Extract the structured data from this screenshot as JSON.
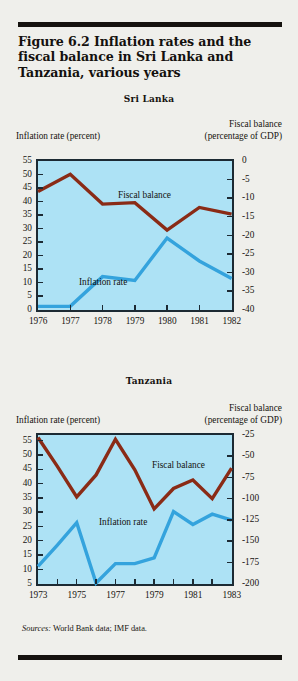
{
  "figure": {
    "title": "Figure 6.2  Inflation rates and the fiscal balance in Sri Lanka and Tanzania, various years",
    "sources_label": "Sources:",
    "sources_text": "World Bank data; IMF data."
  },
  "colors": {
    "page_background": "#efefeb",
    "plot_background": "#ade2f5",
    "axis": "#1c2a33",
    "fiscal_balance_line": "#8a2b16",
    "inflation_rate_line": "#34a3dd",
    "rule": "#15120f",
    "text": "#16130f"
  },
  "chart_data": [
    {
      "type": "line",
      "title": "Sri Lanka",
      "xlabel": "",
      "ylabel": "Inflation rate (percent)",
      "y2label": "Fiscal balance (percentage of GDP)",
      "y2label_line1": "Fiscal balance",
      "y2label_line2": "(percentage of GDP)",
      "grid": false,
      "legend_position": "inline-annotation",
      "x": [
        1976,
        1976.5,
        1977,
        1977.5,
        1978,
        1978.5,
        1979,
        1979.5,
        1980,
        1980.5,
        1981,
        1981.5,
        1982
      ],
      "xtick_labels": [
        "1976",
        "1977",
        "1978",
        "1979",
        "1980",
        "1981",
        "1982"
      ],
      "xticks": [
        1976,
        1977,
        1978,
        1979,
        1980,
        1981,
        1982
      ],
      "xlim": [
        1976,
        1982
      ],
      "ylim": [
        0,
        55
      ],
      "yticks": [
        0,
        5,
        10,
        15,
        20,
        25,
        30,
        35,
        40,
        45,
        50,
        55
      ],
      "ytick_labels": [
        "0",
        "5",
        "10",
        "15",
        "20",
        "25",
        "30",
        "35",
        "40",
        "45",
        "50",
        "55"
      ],
      "y2lim": [
        -40,
        0
      ],
      "y2ticks": [
        0,
        -5,
        -10,
        -15,
        -20,
        -25,
        -30,
        -35,
        -40
      ],
      "y2tick_labels": [
        "0",
        "-5",
        "-10",
        "-15",
        "-20",
        "-25",
        "-30",
        "-35",
        "-40"
      ],
      "series": [
        {
          "name": "Fiscal balance",
          "axis": "right",
          "color": "#8a2b16",
          "annotation": "Fiscal balance",
          "x": [
            1976,
            1977,
            1978,
            1979,
            1980,
            1981,
            1982
          ],
          "values": [
            -8.2,
            -3.6,
            -11.6,
            -11.2,
            -18.6,
            -12.5,
            -14.3
          ]
        },
        {
          "name": "Inflation rate",
          "axis": "left",
          "color": "#34a3dd",
          "annotation": "Inflation rate",
          "x": [
            1976,
            1977,
            1978,
            1979,
            1980,
            1981,
            1982
          ],
          "values": [
            1.2,
            1.2,
            12.2,
            10.8,
            26.5,
            18.0,
            11.5
          ]
        }
      ]
    },
    {
      "type": "line",
      "title": "Tanzania",
      "xlabel": "",
      "ylabel": "Inflation rate (percent)",
      "y2label": "Fiscal balance (percentage of GDP)",
      "y2label_line1": "Fiscal balance",
      "y2label_line2": "(percentage of GDP)",
      "grid": false,
      "legend_position": "inline-annotation",
      "xtick_labels": [
        "1973",
        "1975",
        "1977",
        "1979",
        "1981",
        "1983"
      ],
      "xticks": [
        1973,
        1974,
        1975,
        1976,
        1977,
        1978,
        1979,
        1980,
        1981,
        1982,
        1983
      ],
      "xlim": [
        1973,
        1983
      ],
      "ylim": [
        5,
        57
      ],
      "yticks": [
        5,
        10,
        15,
        20,
        25,
        30,
        35,
        40,
        45,
        50,
        55
      ],
      "ytick_labels": [
        "5",
        "10",
        "15",
        "20",
        "25",
        "30",
        "35",
        "40",
        "45",
        "50",
        "55"
      ],
      "y2lim": [
        -200,
        -25
      ],
      "y2ticks": [
        -25,
        -50,
        -75,
        -100,
        -125,
        -150,
        -175,
        -200
      ],
      "y2tick_labels": [
        "-25",
        "-50",
        "-75",
        "-100",
        "-125",
        "-150",
        "-175",
        "-200"
      ],
      "series": [
        {
          "name": "Fiscal balance",
          "axis": "right",
          "color": "#8a2b16",
          "annotation": "Fiscal balance",
          "x": [
            1973,
            1974,
            1975,
            1976,
            1977,
            1978,
            1979,
            1980,
            1981,
            1982,
            1983
          ],
          "values": [
            -28,
            -62,
            -98,
            -72,
            -30,
            -66,
            -112,
            -88,
            -78,
            -100,
            -64
          ]
        },
        {
          "name": "Inflation rate",
          "axis": "left",
          "color": "#34a3dd",
          "annotation": "Inflation rate",
          "x": [
            1973,
            1974,
            1975,
            1976,
            1977,
            1978,
            1979,
            1980,
            1981,
            1982,
            1983
          ],
          "values": [
            11.0,
            18.5,
            26.3,
            5.2,
            12.0,
            12.0,
            14.0,
            30.2,
            25.7,
            29.3,
            27.2
          ]
        }
      ]
    }
  ]
}
